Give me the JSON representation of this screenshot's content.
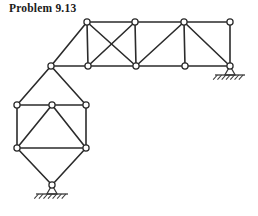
{
  "page": {
    "title": "Problem 9.13",
    "width": 258,
    "height": 216,
    "background": "#ffffff"
  },
  "figure": {
    "name": "truss-structure-diagram",
    "type": "engineering-truss-line-drawing",
    "member_color": "#2b2b2b",
    "member_width": 1.6,
    "joint_fill": "#ffffff",
    "joint_stroke": "#2b2b2b",
    "joint_radius": 3.1,
    "ground_color": "#3a3a3a",
    "joints": [
      {
        "id": "T1",
        "label": "top-chord-joint-1",
        "x": 87,
        "y": 22
      },
      {
        "id": "T2",
        "label": "top-chord-joint-2",
        "x": 135,
        "y": 22
      },
      {
        "id": "T3",
        "label": "top-chord-joint-3",
        "x": 184,
        "y": 22
      },
      {
        "id": "T4",
        "label": "top-chord-joint-4",
        "x": 230,
        "y": 22
      },
      {
        "id": "B0",
        "label": "corner-joint-left",
        "x": 51,
        "y": 66
      },
      {
        "id": "B1",
        "label": "bottom-chord-joint-1",
        "x": 88,
        "y": 66
      },
      {
        "id": "B2",
        "label": "bottom-chord-joint-2",
        "x": 136,
        "y": 66
      },
      {
        "id": "B3",
        "label": "bottom-chord-joint-3",
        "x": 185,
        "y": 66
      },
      {
        "id": "B4",
        "label": "bottom-chord-joint-right-support",
        "x": 230,
        "y": 66
      },
      {
        "id": "L1",
        "label": "lower-panel-joint-left-upper",
        "x": 17,
        "y": 105
      },
      {
        "id": "L2",
        "label": "lower-panel-joint-right-upper",
        "x": 86,
        "y": 105
      },
      {
        "id": "L3",
        "label": "lower-panel-joint-left-lower",
        "x": 17,
        "y": 148
      },
      {
        "id": "L4",
        "label": "lower-panel-joint-right-lower",
        "x": 86,
        "y": 148
      },
      {
        "id": "L5",
        "label": "lower-panel-apex-joint",
        "x": 52,
        "y": 105
      },
      {
        "id": "P1",
        "label": "bottom-pin-support-joint",
        "x": 52,
        "y": 185
      }
    ],
    "members": [
      {
        "from": "T1",
        "to": "T2",
        "name": "top-chord-member-1"
      },
      {
        "from": "T2",
        "to": "T3",
        "name": "top-chord-member-2"
      },
      {
        "from": "T3",
        "to": "T4",
        "name": "top-chord-member-3"
      },
      {
        "from": "B0",
        "to": "B1",
        "name": "bottom-chord-member-0"
      },
      {
        "from": "B1",
        "to": "B2",
        "name": "bottom-chord-member-1"
      },
      {
        "from": "B2",
        "to": "B3",
        "name": "bottom-chord-member-2"
      },
      {
        "from": "B3",
        "to": "B4",
        "name": "bottom-chord-member-3"
      },
      {
        "from": "T1",
        "to": "B1",
        "name": "vertical-member-1"
      },
      {
        "from": "T2",
        "to": "B2",
        "name": "vertical-member-2"
      },
      {
        "from": "T3",
        "to": "B3",
        "name": "vertical-member-3"
      },
      {
        "from": "T4",
        "to": "B4",
        "name": "vertical-member-4"
      },
      {
        "from": "T1",
        "to": "B0",
        "name": "diagonal-member-1"
      },
      {
        "from": "T1",
        "to": "B2",
        "name": "diagonal-member-2"
      },
      {
        "from": "T2",
        "to": "B1",
        "name": "diagonal-member-3"
      },
      {
        "from": "T3",
        "to": "B2",
        "name": "diagonal-member-4"
      },
      {
        "from": "T3",
        "to": "B4",
        "name": "diagonal-member-5"
      },
      {
        "from": "B0",
        "to": "L1",
        "name": "upper-left-chord-member"
      },
      {
        "from": "B0",
        "to": "L2",
        "name": "upper-right-chord-member"
      },
      {
        "from": "L1",
        "to": "L2",
        "name": "lower-panel-top-chord"
      },
      {
        "from": "L1",
        "to": "L3",
        "name": "lower-panel-left-vertical"
      },
      {
        "from": "L2",
        "to": "L4",
        "name": "lower-panel-right-vertical"
      },
      {
        "from": "L3",
        "to": "L4",
        "name": "lower-panel-bottom-chord"
      },
      {
        "from": "L3",
        "to": "L5",
        "name": "lower-panel-diagonal-left"
      },
      {
        "from": "L5",
        "to": "L4",
        "name": "lower-panel-diagonal-right"
      },
      {
        "from": "L3",
        "to": "P1",
        "name": "support-strut-left"
      },
      {
        "from": "L4",
        "to": "P1",
        "name": "support-strut-right"
      }
    ],
    "supports": [
      {
        "id": "support-right",
        "name": "roller-support-right",
        "x": 230,
        "y": 66,
        "hatch_half_width": 15,
        "hatch_ticks": 7
      },
      {
        "id": "support-bottom",
        "name": "pin-support-bottom",
        "x": 52,
        "y": 185,
        "hatch_half_width": 16,
        "hatch_ticks": 7
      }
    ]
  }
}
